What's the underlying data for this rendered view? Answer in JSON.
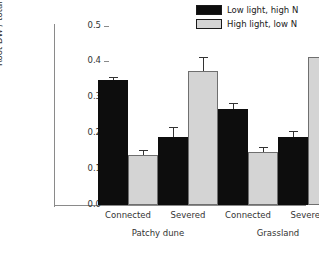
{
  "chart_data": {
    "type": "bar",
    "title": "",
    "xlabel": "",
    "ylabel": "Root DW / total DW",
    "ylim": [
      0.0,
      0.5
    ],
    "ytick_labels": [
      "0.0",
      "0.1",
      "0.2",
      "0.3",
      "0.4",
      "0.5"
    ],
    "ytick_values": [
      0.0,
      0.1,
      0.2,
      0.3,
      0.4,
      0.5
    ],
    "grid": false,
    "legend_position": "top-right",
    "categories": [
      "Connected",
      "Severed",
      "Connected",
      "Severed"
    ],
    "group_labels": [
      "Patchy dune",
      "Grassland"
    ],
    "series": [
      {
        "name": "Low light, high N",
        "color": "#0d0d0d",
        "values": [
          0.35,
          0.19,
          0.267,
          0.19
        ],
        "errors": [
          0.005,
          0.025,
          0.015,
          0.015
        ]
      },
      {
        "name": "High light, low N",
        "color": "#d4d4d4",
        "values": [
          0.14,
          0.375,
          0.147,
          0.413
        ],
        "errors": [
          0.01,
          0.035,
          0.013,
          0.02
        ]
      }
    ]
  },
  "legend": {
    "items": [
      {
        "label": "Low light, high N",
        "color": "#0d0d0d"
      },
      {
        "label": "High light, low N",
        "color": "#d4d4d4"
      }
    ]
  },
  "axis": {
    "y_title": "Root DW / total DW",
    "y_ticks": [
      "0.5",
      "0.4",
      "0.3",
      "0.2",
      "0.1",
      "0.0"
    ]
  },
  "x_axis": {
    "tick_labels": [
      "Connected",
      "Severed",
      "Connected",
      "Severed"
    ],
    "group_labels": [
      "Patchy dune",
      "Grassland"
    ]
  }
}
